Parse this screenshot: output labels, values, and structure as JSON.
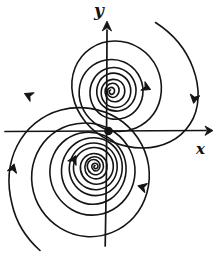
{
  "figure": {
    "kind": "phase-portrait",
    "background_color": "#ffffff",
    "ink_color": "#141414",
    "axes": {
      "origin": {
        "x": 108,
        "y": 131
      },
      "x_axis": {
        "label": "x",
        "label_position": {
          "x": 196,
          "y": 142
        },
        "start": {
          "x": 5,
          "y": 131
        },
        "end": {
          "x": 212,
          "y": 131
        },
        "arrow_at_end": true
      },
      "y_axis": {
        "label": "y",
        "label_position": {
          "x": 94,
          "y": 2
        },
        "start": {
          "x": 105,
          "y": 246
        },
        "end": {
          "x": 107,
          "y": 22
        },
        "arrow_at_end": true
      }
    },
    "spiral": {
      "type": "logarithmic",
      "direction": "counterclockwise-inward",
      "turns": 2.6,
      "stroke_width": 1.6,
      "center": {
        "x": 108,
        "y": 131
      },
      "x_axis_crossings_positive": [
        113,
        122,
        134,
        152,
        186
      ],
      "x_axis_crossings_negative": [
        95,
        82,
        62,
        38,
        14
      ],
      "outer_end_upper_right": {
        "x": 155,
        "y": 22
      },
      "outer_end_lower_left": {
        "x": 40,
        "y": 250
      }
    },
    "flow_arrows": [
      {
        "name": "arrow-upper-right",
        "x": 143,
        "y": 86,
        "angle": 25
      },
      {
        "name": "arrow-outer-right",
        "x": 195,
        "y": 95,
        "angle": 100
      },
      {
        "name": "arrow-outer-left",
        "x": 32,
        "y": 97,
        "angle": -155
      },
      {
        "name": "arrow-far-left",
        "x": 12,
        "y": 172,
        "angle": -75
      },
      {
        "name": "arrow-inner-lower-left",
        "x": 72,
        "y": 163,
        "angle": -62
      },
      {
        "name": "arrow-lower-right",
        "x": 146,
        "y": 188,
        "angle": 196
      }
    ]
  }
}
